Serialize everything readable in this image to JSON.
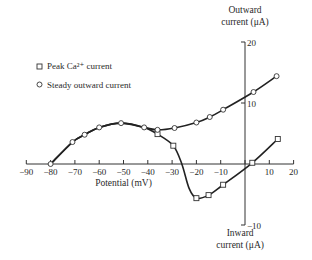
{
  "chart_data": {
    "type": "line",
    "title": "",
    "xlabel": "Potential (mV)",
    "ylabel_top": [
      "Outward",
      "current (μA)"
    ],
    "ylabel_bottom": [
      "Inward",
      "current (μA)"
    ],
    "xlim": [
      -90,
      20
    ],
    "ylim": [
      -10,
      20
    ],
    "x_ticks": [
      -90,
      -80,
      -70,
      -60,
      -50,
      -40,
      -30,
      -20,
      -10,
      0,
      10,
      20
    ],
    "x_tick_labels": [
      "−90",
      "−80",
      "−70",
      "−60",
      "−50",
      "−40",
      "−30",
      "−20",
      "−10",
      "",
      "10",
      "20"
    ],
    "y_ticks": [
      20,
      10,
      -10
    ],
    "y_tick_labels": [
      "20",
      "10",
      "−10"
    ],
    "grid": false,
    "legend_position": "upper-left",
    "series": [
      {
        "name": "Peak Ca²⁺ current",
        "marker": "square",
        "curve_points": [
          [
            -80,
            0
          ],
          [
            -71,
            3.6
          ],
          [
            -66,
            4.8
          ],
          [
            -60,
            6.0
          ],
          [
            -51,
            6.7
          ],
          [
            -41.5,
            6.0
          ],
          [
            -36,
            4.9
          ],
          [
            -29.5,
            3.0
          ],
          [
            -26,
            0
          ],
          [
            -23,
            -4.0
          ],
          [
            -20,
            -5.6
          ],
          [
            -15,
            -5.1
          ],
          [
            -9,
            -3.4
          ],
          [
            3,
            0.2
          ],
          [
            13.5,
            4.1
          ]
        ],
        "points": [
          [
            -36,
            4.9
          ],
          [
            -29.5,
            3.0
          ],
          [
            -20,
            -5.6
          ],
          [
            -15,
            -5.1
          ],
          [
            -9,
            -3.4
          ],
          [
            3,
            0.2
          ],
          [
            13.5,
            4.1
          ]
        ]
      },
      {
        "name": "Steady outward current",
        "marker": "circle",
        "curve_points": [
          [
            -80,
            0
          ],
          [
            -71,
            3.6
          ],
          [
            -66,
            4.8
          ],
          [
            -60,
            6.0
          ],
          [
            -51,
            6.7
          ],
          [
            -41.5,
            6.0
          ],
          [
            -36,
            5.6
          ],
          [
            -29,
            5.9
          ],
          [
            -20,
            6.8
          ],
          [
            -14.5,
            7.7
          ],
          [
            -9,
            8.9
          ],
          [
            3.5,
            11.8
          ],
          [
            13,
            14.4
          ]
        ],
        "points": [
          [
            -80,
            0
          ],
          [
            -71,
            3.6
          ],
          [
            -66,
            4.8
          ],
          [
            -60,
            6.0
          ],
          [
            -51,
            6.7
          ],
          [
            -41.5,
            6.0
          ],
          [
            -36,
            5.6
          ],
          [
            -29,
            5.9
          ],
          [
            -20,
            6.8
          ],
          [
            -14.5,
            7.7
          ],
          [
            -9,
            8.9
          ],
          [
            3.5,
            11.8
          ],
          [
            13,
            14.4
          ]
        ]
      }
    ]
  }
}
